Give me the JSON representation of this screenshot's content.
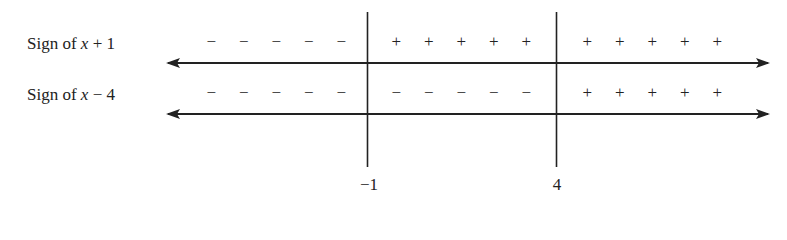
{
  "rows": [
    {
      "label_prefix": "Sign of ",
      "label_var": "x",
      "label_suffix": " + 1",
      "intervals": [
        {
          "signs": [
            "−",
            "−",
            "−",
            "−",
            "−"
          ]
        },
        {
          "signs": [
            "+",
            "+",
            "+",
            "+",
            "+"
          ]
        },
        {
          "signs": [
            "+",
            "+",
            "+",
            "+",
            "+"
          ]
        }
      ]
    },
    {
      "label_prefix": "Sign of ",
      "label_var": "x",
      "label_suffix": " − 4",
      "intervals": [
        {
          "signs": [
            "−",
            "−",
            "−",
            "−",
            "−"
          ]
        },
        {
          "signs": [
            "−",
            "−",
            "−",
            "−",
            "−"
          ]
        },
        {
          "signs": [
            "+",
            "+",
            "+",
            "+",
            "+"
          ]
        }
      ]
    }
  ],
  "critical_points": [
    {
      "label": "−1",
      "value": -1
    },
    {
      "label": "4",
      "value": 4
    }
  ],
  "colors": {
    "ink": "#222222",
    "background": "#ffffff"
  }
}
